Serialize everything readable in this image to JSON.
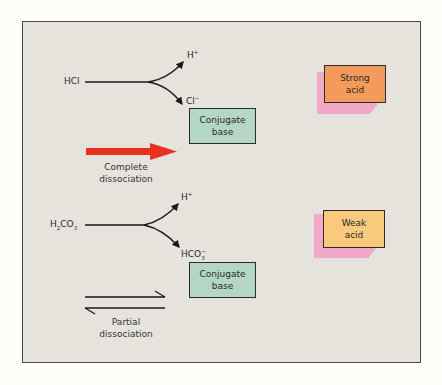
{
  "figure": {
    "strong_section": {
      "reactant": "HCl",
      "product_top": {
        "base": "H",
        "sup": "+"
      },
      "product_bottom": {
        "base": "Cl",
        "sup": "−"
      },
      "conjugate_box": {
        "line1": "Conjugate",
        "line2": "base"
      },
      "arrow_caption": {
        "line1": "Complete",
        "line2": "dissociation"
      },
      "arrow_color": "#e8321e",
      "acid_box": {
        "line1": "Strong",
        "line2": "acid",
        "color": "#f49a5a"
      }
    },
    "weak_section": {
      "reactant": {
        "p1": "H",
        "sub1": "2",
        "p2": "CO",
        "sub2": "3"
      },
      "product_top": {
        "base": "H",
        "sup": "+"
      },
      "product_bottom": {
        "base": "HCO",
        "sup": "−",
        "sub": "3"
      },
      "conjugate_box": {
        "line1": "Conjugate",
        "line2": "base"
      },
      "arrow_caption": {
        "line1": "Partial",
        "line2": "dissociation"
      },
      "acid_box": {
        "line1": "Weak",
        "line2": "acid",
        "color": "#f9c97c"
      }
    },
    "colors": {
      "background": "#e6e3dd",
      "conjugate_box": "#b4d6c4",
      "shadow": "#f2a9c9"
    }
  }
}
